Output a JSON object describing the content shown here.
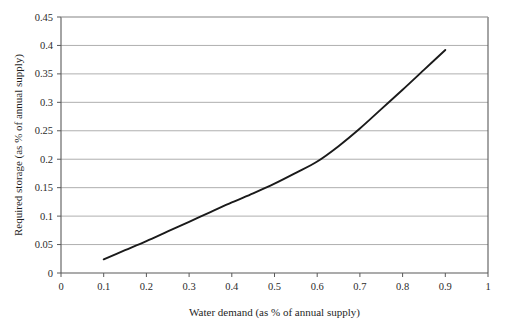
{
  "chart_data": {
    "type": "line",
    "title": "",
    "xlabel": "Water demand (as % of annual supply)",
    "ylabel": "Required storage (as % of annual supply)",
    "xlim": [
      0,
      1
    ],
    "ylim": [
      0,
      0.45
    ],
    "xticks": [
      "0",
      "0.1",
      "0.2",
      "0.3",
      "0.4",
      "0.5",
      "0.6",
      "0.7",
      "0.8",
      "0.9",
      "1"
    ],
    "xtick_values": [
      0,
      0.1,
      0.2,
      0.3,
      0.4,
      0.5,
      0.6,
      0.7,
      0.8,
      0.9,
      1
    ],
    "yticks": [
      "0",
      "0.05",
      "0.1",
      "0.15",
      "0.2",
      "0.25",
      "0.3",
      "0.35",
      "0.4",
      "0.45"
    ],
    "ytick_values": [
      0,
      0.05,
      0.1,
      0.15,
      0.2,
      0.25,
      0.3,
      0.35,
      0.4,
      0.45
    ],
    "grid": "horizontal",
    "legend": "none",
    "series": [
      {
        "name": "Required storage",
        "color": "#1a1a1a",
        "x": [
          0.1,
          0.15,
          0.2,
          0.25,
          0.3,
          0.35,
          0.4,
          0.45,
          0.5,
          0.55,
          0.6,
          0.65,
          0.7,
          0.75,
          0.8,
          0.85,
          0.9
        ],
        "values": [
          0.024,
          0.04,
          0.056,
          0.073,
          0.09,
          0.107,
          0.124,
          0.14,
          0.157,
          0.176,
          0.196,
          0.223,
          0.254,
          0.288,
          0.322,
          0.357,
          0.392
        ]
      }
    ]
  },
  "geometry": {
    "plot_left": 61,
    "plot_right": 488,
    "plot_top": 17,
    "plot_bottom": 273
  },
  "colors": {
    "line": "#1a1a1a",
    "grid": "#a6a6a6",
    "axis": "#595959",
    "text": "#2b2b2b",
    "background": "#ffffff"
  }
}
